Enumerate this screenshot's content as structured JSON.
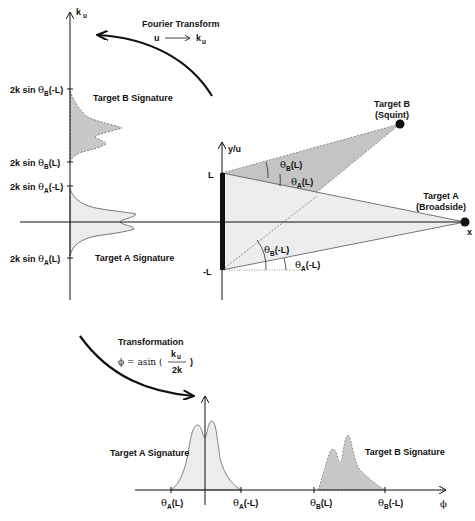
{
  "diagram": {
    "colors": {
      "axis": "#111111",
      "target_a_fill": "#e8e8e8",
      "target_b_fill": "#c8c8c8",
      "curve_stroke": "#555555"
    },
    "top_left_plot": {
      "axis_label": "k",
      "axis_label_sub": "u",
      "ticks": [
        {
          "id": "b_minus_L",
          "pre": "2k sin ",
          "sym": "θ",
          "sub": "B",
          "post": "(-L)"
        },
        {
          "id": "b_L",
          "pre": "2k sin ",
          "sym": "θ",
          "sub": "B",
          "post": "(L)"
        },
        {
          "id": "a_minus_L",
          "pre": "2k sin ",
          "sym": "θ",
          "sub": "A",
          "post": "(-L)"
        },
        {
          "id": "a_L",
          "pre": "2k sin ",
          "sym": "θ",
          "sub": "A",
          "post": "(L)"
        }
      ],
      "target_b_label": "Target B Signature",
      "target_a_label": "Target A Signature"
    },
    "fourier": {
      "title": "Fourier Transform",
      "from": "u",
      "arrow": "⟶",
      "to": "k",
      "to_sub": "u"
    },
    "geometry": {
      "y_axis_label": "y/u",
      "x_axis_label": "x",
      "L_label": "L",
      "minus_L_label": "-L",
      "target_a": {
        "name": "Target A",
        "desc": "(Broadside)"
      },
      "target_b": {
        "name": "Target B",
        "desc": "(Squint)"
      },
      "angles": [
        {
          "id": "thetaB_L",
          "sym": "θ",
          "sub": "B",
          "post": "(L)"
        },
        {
          "id": "thetaA_L",
          "sym": "θ",
          "sub": "A",
          "post": "(L)"
        },
        {
          "id": "thetaB_mL",
          "sym": "θ",
          "sub": "B",
          "post": "(-L)"
        },
        {
          "id": "thetaA_mL",
          "sym": "θ",
          "sub": "A",
          "post": "(-L)"
        }
      ]
    },
    "transformation": {
      "title": "Transformation",
      "lhs": "ϕ = asin (",
      "num": "k",
      "num_sub": "u",
      "den": "2k",
      "rhs": ")"
    },
    "bottom_plot": {
      "axis_label": "ϕ",
      "target_a_label": "Target A Signature",
      "target_b_label": "Target B Signature",
      "ticks": [
        {
          "id": "a_L",
          "sym": "θ",
          "sub": "A",
          "post": "(L)"
        },
        {
          "id": "a_mL",
          "sym": "θ",
          "sub": "A",
          "post": "(-L)"
        },
        {
          "id": "b_L",
          "sym": "θ",
          "sub": "B",
          "post": "(L)"
        },
        {
          "id": "b_mL",
          "sym": "θ",
          "sub": "B",
          "post": "(-L)"
        }
      ]
    }
  }
}
